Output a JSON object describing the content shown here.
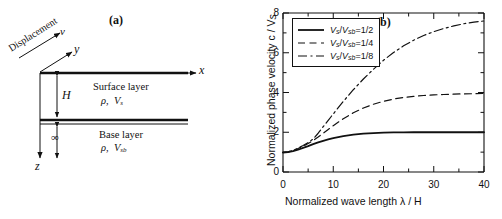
{
  "figure": {
    "panel_a": {
      "tag": "(a)",
      "displacement_label": "Displacement",
      "v_label": "v",
      "y_axis_label": "y",
      "x_axis_label": "x",
      "z_axis_label": "z",
      "thickness_label": "H",
      "infinity_label": "∞",
      "surface_layer_name": "Surface layer",
      "surface_layer_props_rho": "ρ",
      "surface_layer_props_sep": ",",
      "surface_layer_props_v": "V",
      "surface_layer_props_v_sub": "s",
      "base_layer_name": "Base layer",
      "base_layer_props_rho": "ρ",
      "base_layer_props_sep": ",",
      "base_layer_props_v": "V",
      "base_layer_props_v_sub": "sb"
    },
    "panel_b": {
      "tag": "(b)"
    }
  },
  "chart_data": {
    "type": "line",
    "title": "(b)",
    "xlabel": "Normalized wave length  λ / H",
    "ylabel": "Normalized phase velocity  c / V",
    "ylabel_sub": "s",
    "xlim": [
      0,
      40
    ],
    "ylim": [
      0,
      8
    ],
    "xticks": [
      0,
      10,
      20,
      30,
      40
    ],
    "xtick_labels": [
      "0",
      "10",
      "20",
      "30",
      "40"
    ],
    "xminor_step": 5,
    "yticks": [
      0,
      2,
      4,
      6,
      8
    ],
    "ytick_labels": [
      "0",
      "2",
      "4",
      "6",
      "8"
    ],
    "yminor_step": 1,
    "grid": false,
    "legend_position": "upper-left",
    "series": [
      {
        "name": "V_s/V_sb=1/2",
        "legend_num": "V",
        "legend_num_sub": "s",
        "legend_den": "V",
        "legend_den_sub": "sb",
        "legend_value": "=1/2",
        "style": "solid",
        "x": [
          0,
          1,
          2,
          3,
          4,
          5,
          6,
          7,
          8,
          9,
          10,
          12,
          14,
          16,
          18,
          20,
          22,
          24,
          26,
          28,
          30,
          32,
          34,
          36,
          38,
          40
        ],
        "y": [
          0.98,
          1.0,
          1.05,
          1.12,
          1.21,
          1.3,
          1.4,
          1.49,
          1.57,
          1.64,
          1.71,
          1.81,
          1.88,
          1.93,
          1.96,
          1.98,
          1.99,
          1.99,
          2.0,
          2.0,
          2.0,
          2.0,
          2.0,
          2.0,
          2.0,
          2.0
        ]
      },
      {
        "name": "V_s/V_sb=1/4",
        "legend_num": "V",
        "legend_num_sub": "s",
        "legend_den": "V",
        "legend_den_sub": "sb",
        "legend_value": "=1/4",
        "style": "dashed",
        "x": [
          0,
          1,
          2,
          3,
          4,
          5,
          6,
          7,
          8,
          9,
          10,
          12,
          14,
          16,
          18,
          20,
          22,
          24,
          26,
          28,
          30,
          32,
          34,
          36,
          38,
          40
        ],
        "y": [
          0.98,
          1.01,
          1.08,
          1.18,
          1.3,
          1.43,
          1.58,
          1.76,
          1.95,
          2.14,
          2.33,
          2.68,
          2.98,
          3.22,
          3.41,
          3.56,
          3.67,
          3.75,
          3.81,
          3.85,
          3.88,
          3.9,
          3.92,
          3.93,
          3.94,
          3.95
        ]
      },
      {
        "name": "V_s/V_sb=1/8",
        "legend_num": "V",
        "legend_num_sub": "s",
        "legend_den": "V",
        "legend_den_sub": "sb",
        "legend_value": "=1/8",
        "style": "dashdot",
        "x": [
          0,
          1,
          2,
          3,
          4,
          5,
          6,
          7,
          8,
          9,
          10,
          12,
          14,
          16,
          18,
          20,
          22,
          24,
          26,
          28,
          30,
          32,
          34,
          36,
          38,
          40
        ],
        "y": [
          0.98,
          1.01,
          1.09,
          1.2,
          1.33,
          1.48,
          1.66,
          1.95,
          2.28,
          2.6,
          2.92,
          3.55,
          4.14,
          4.68,
          5.17,
          5.62,
          6.01,
          6.35,
          6.63,
          6.87,
          7.06,
          7.22,
          7.35,
          7.46,
          7.54,
          7.6
        ]
      }
    ]
  }
}
